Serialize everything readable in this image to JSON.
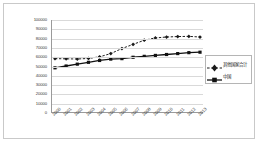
{
  "chart_data": {
    "type": "line",
    "title": "",
    "xlabel": "",
    "ylabel": "",
    "ylim": [
      0,
      100000
    ],
    "ytick_step": 10000,
    "grid": true,
    "legend_position": "right-inside",
    "categories": [
      "2000",
      "2001",
      "2002",
      "2003",
      "2004",
      "2005",
      "2006",
      "2007",
      "2008",
      "2009",
      "2010",
      "2011",
      "2012",
      "2013"
    ],
    "yticks": [
      "100000",
      "90000",
      "80000",
      "70000",
      "60000",
      "50000",
      "40000",
      "30000",
      "20000",
      "10000",
      "0"
    ],
    "series": [
      {
        "name": "其他国家合计",
        "marker": "diamond",
        "line_style": "dashed",
        "color": "#1a1a1a",
        "values": [
          58000,
          57800,
          57600,
          58200,
          60000,
          63500,
          69000,
          73500,
          78000,
          80500,
          81500,
          82000,
          82200,
          81500
        ]
      },
      {
        "name": "中国",
        "marker": "square",
        "line_style": "solid",
        "color": "#111111",
        "values": [
          48000,
          50000,
          52000,
          54000,
          56000,
          57500,
          58000,
          59500,
          60500,
          61500,
          62500,
          63500,
          64500,
          65000
        ]
      }
    ]
  },
  "legend": {
    "items": [
      {
        "label": "其他国家合计",
        "marker": "diamond",
        "style": "dashed"
      },
      {
        "label": "中国",
        "marker": "square",
        "style": "solid"
      }
    ]
  }
}
